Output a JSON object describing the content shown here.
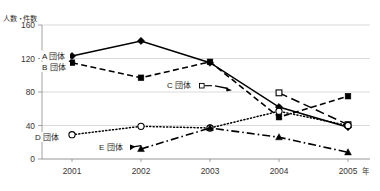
{
  "figure": {
    "title_strip": "",
    "y_axis_caption": "人数・件数",
    "x_unit": "年"
  },
  "axes": {
    "y_ticks": [
      "0",
      "40",
      "80",
      "120",
      "160"
    ],
    "x_ticks": [
      "2001",
      "2002",
      "2003",
      "2004",
      "2005"
    ]
  },
  "labels": {
    "a": "A 団体",
    "b": "B 団体",
    "c": "C 団体",
    "d": "D 団体",
    "e": "E 団体"
  },
  "chart_data": {
    "type": "line",
    "title": "",
    "xlabel": "年",
    "ylabel": "人数・件数",
    "categories": [
      "2001",
      "2002",
      "2003",
      "2004",
      "2005"
    ],
    "x": [
      2001,
      2002,
      2003,
      2004,
      2005
    ],
    "ylim": [
      0,
      160
    ],
    "yticks": [
      0,
      40,
      80,
      120,
      160
    ],
    "grid": "horizontal",
    "legend": "inline-labels",
    "series": [
      {
        "name": "A 団体",
        "values": [
          123,
          141,
          115,
          62,
          38
        ],
        "marker": "filled-diamond",
        "line_style": "solid"
      },
      {
        "name": "B 団体",
        "values": [
          115,
          97,
          116,
          50,
          75
        ],
        "marker": "filled-square",
        "line_style": "dashed"
      },
      {
        "name": "C 団体",
        "values": [
          null,
          null,
          null,
          79,
          41
        ],
        "marker": "open-square",
        "line_style": "long-dash"
      },
      {
        "name": "D 団体",
        "values": [
          29,
          39,
          37,
          57,
          40
        ],
        "marker": "open-circle",
        "line_style": "dotted"
      },
      {
        "name": "E 団体",
        "values": [
          null,
          12,
          37,
          26,
          8
        ],
        "marker": "filled-triangle",
        "line_style": "dash-dot"
      }
    ]
  }
}
